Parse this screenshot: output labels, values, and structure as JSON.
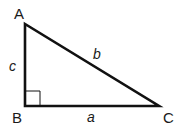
{
  "diagram": {
    "type": "right-triangle",
    "colors": {
      "stroke": "#111111",
      "text": "#1a1a1a",
      "background": "#ffffff"
    },
    "vertices": {
      "A": {
        "label": "A",
        "x": 25,
        "y": 24
      },
      "B": {
        "label": "B",
        "x": 25,
        "y": 106
      },
      "C": {
        "label": "C",
        "x": 159,
        "y": 106
      }
    },
    "sides": {
      "a": {
        "label": "a",
        "between": "B-C"
      },
      "b": {
        "label": "b",
        "between": "A-C"
      },
      "c": {
        "label": "c",
        "between": "A-B"
      }
    },
    "right_angle_marker": {
      "at": "B",
      "size": 15
    }
  }
}
